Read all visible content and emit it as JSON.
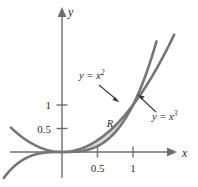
{
  "chart_data": {
    "type": "line",
    "title": "",
    "xlabel": "x",
    "ylabel": "y",
    "xlim": [
      -0.8,
      1.45
    ],
    "ylim": [
      -0.35,
      1.75
    ],
    "grid": false,
    "legend": "none",
    "x_ticks": [
      {
        "value": 0.5,
        "label": "0.5"
      },
      {
        "value": 1,
        "label": "1"
      }
    ],
    "y_ticks": [
      {
        "value": 0.5,
        "label": "0.5"
      },
      {
        "value": 1,
        "label": "1"
      }
    ],
    "series": [
      {
        "name": "y = x^2",
        "label": "y = x",
        "exponent": "2",
        "equation": "y = x²",
        "color": "#767676",
        "x": [
          -0.8,
          -0.6,
          -0.4,
          -0.2,
          0,
          0.2,
          0.4,
          0.5,
          0.6,
          0.8,
          1,
          1.2,
          1.3
        ],
        "y": [
          0.64,
          0.36,
          0.16,
          0.04,
          0,
          0.04,
          0.16,
          0.25,
          0.36,
          0.64,
          1,
          1.44,
          1.69
        ]
      },
      {
        "name": "y = x^3",
        "label": "y = x",
        "exponent": "3",
        "equation": "y = x³",
        "color": "#767676",
        "x": [
          -0.8,
          -0.6,
          -0.4,
          -0.2,
          0,
          0.2,
          0.4,
          0.5,
          0.6,
          0.8,
          1,
          1.15,
          1.22
        ],
        "y": [
          -0.512,
          -0.216,
          -0.064,
          -0.008,
          0,
          0.008,
          0.064,
          0.125,
          0.216,
          0.512,
          1,
          1.52,
          1.82
        ]
      }
    ],
    "shaded_region": {
      "label": "R",
      "fill_color": "#d9d9d9",
      "bounded_by": [
        "y = x^2",
        "y = x^3"
      ],
      "x_from": 0,
      "x_to": 1
    },
    "annotations": [
      {
        "name": "label-x-squared",
        "text": "y = x",
        "exponent": "2",
        "arrow": "down-right"
      },
      {
        "name": "label-x-cubed",
        "text": "y = x",
        "exponent": "3",
        "arrow": "up-left"
      },
      {
        "name": "region-label",
        "text": "R"
      }
    ]
  },
  "axes": {
    "x_axis_name": "x",
    "y_axis_name": "y"
  }
}
